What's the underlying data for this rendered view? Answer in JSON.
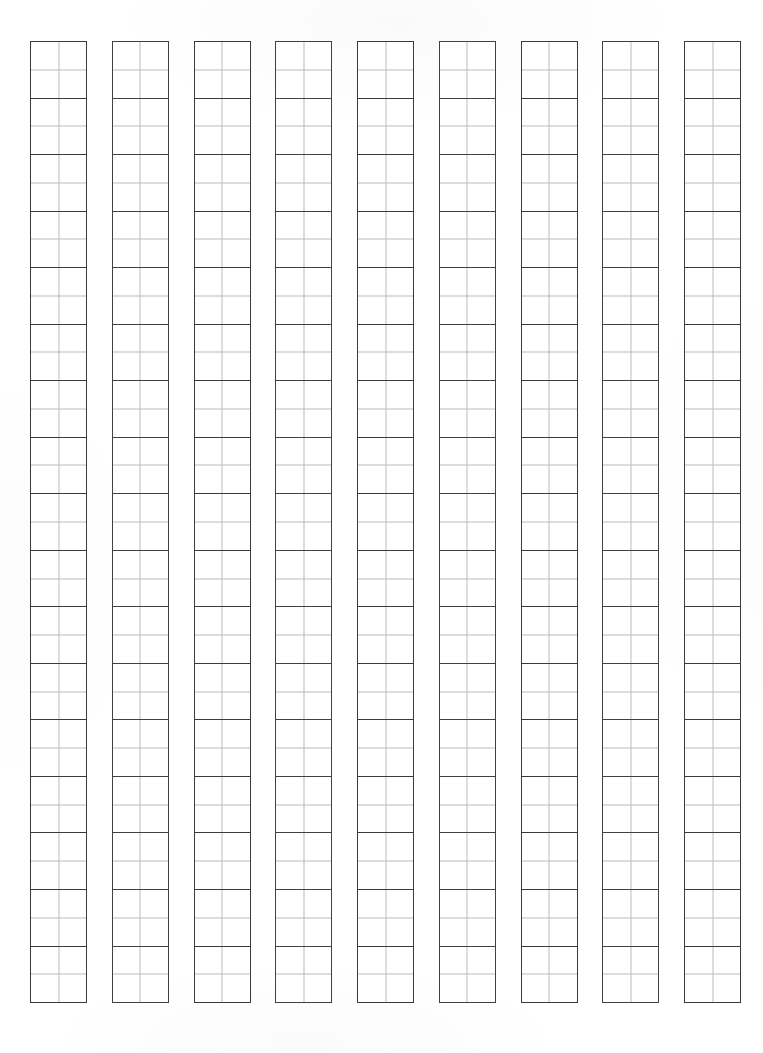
{
  "document": {
    "title": "Grid Writing Sheet",
    "kind": "genko-yoshi-grid-paper",
    "page_width_px": 763,
    "page_height_px": 1053,
    "background_color": "#ffffff",
    "orientation": "portrait",
    "has_text_content": false,
    "content_note": "Blank printable manuscript grid — all cells empty"
  },
  "grid": {
    "columns": 9,
    "rows_per_column": 17,
    "total_cells": 153,
    "cell_width_px": 57,
    "cell_height_px": 56.6,
    "column_gap_px": 24,
    "grid_left_px": 30,
    "grid_top_px": 41,
    "grid_width_px": 711,
    "grid_height_px": 962,
    "cell_border_color": "#3d3d3f",
    "cell_border_width_px": 1.15,
    "guide_line_color": "#bcbcbe",
    "guide_line_width_px": 1,
    "guides_per_cell": 2,
    "guide_orientation": [
      "vertical-center",
      "horizontal-center"
    ],
    "cell_fill_color": "#ffffff"
  },
  "columns": [
    {
      "index": 1,
      "label": "column-1",
      "cells": [
        "",
        "",
        "",
        "",
        "",
        "",
        "",
        "",
        "",
        "",
        "",
        "",
        "",
        "",
        "",
        "",
        ""
      ]
    },
    {
      "index": 2,
      "label": "column-2",
      "cells": [
        "",
        "",
        "",
        "",
        "",
        "",
        "",
        "",
        "",
        "",
        "",
        "",
        "",
        "",
        "",
        "",
        ""
      ]
    },
    {
      "index": 3,
      "label": "column-3",
      "cells": [
        "",
        "",
        "",
        "",
        "",
        "",
        "",
        "",
        "",
        "",
        "",
        "",
        "",
        "",
        "",
        "",
        ""
      ]
    },
    {
      "index": 4,
      "label": "column-4",
      "cells": [
        "",
        "",
        "",
        "",
        "",
        "",
        "",
        "",
        "",
        "",
        "",
        "",
        "",
        "",
        "",
        "",
        ""
      ]
    },
    {
      "index": 5,
      "label": "column-5",
      "cells": [
        "",
        "",
        "",
        "",
        "",
        "",
        "",
        "",
        "",
        "",
        "",
        "",
        "",
        "",
        "",
        "",
        ""
      ]
    },
    {
      "index": 6,
      "label": "column-6",
      "cells": [
        "",
        "",
        "",
        "",
        "",
        "",
        "",
        "",
        "",
        "",
        "",
        "",
        "",
        "",
        "",
        "",
        ""
      ]
    },
    {
      "index": 7,
      "label": "column-7",
      "cells": [
        "",
        "",
        "",
        "",
        "",
        "",
        "",
        "",
        "",
        "",
        "",
        "",
        "",
        "",
        "",
        "",
        ""
      ]
    },
    {
      "index": 8,
      "label": "column-8",
      "cells": [
        "",
        "",
        "",
        "",
        "",
        "",
        "",
        "",
        "",
        "",
        "",
        "",
        "",
        "",
        "",
        "",
        ""
      ]
    },
    {
      "index": 9,
      "label": "column-9",
      "cells": [
        "",
        "",
        "",
        "",
        "",
        "",
        "",
        "",
        "",
        "",
        "",
        "",
        "",
        "",
        "",
        "",
        ""
      ]
    }
  ],
  "margins": {
    "top_px": 41,
    "bottom_px": 50,
    "left_px": 30,
    "right_px": 22
  }
}
